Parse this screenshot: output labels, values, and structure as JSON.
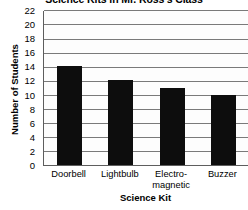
{
  "chart_data": {
    "type": "bar",
    "title": "Science Kits in Mr. Ross's Class",
    "xlabel": "Science Kit",
    "ylabel": "Number of Students",
    "categories": [
      "Doorbell",
      "Lightbulb",
      "Electro-magnetic",
      "Buzzer"
    ],
    "category_lines": [
      [
        "Doorbell"
      ],
      [
        "Lightbulb"
      ],
      [
        "Electro-",
        "magnetic"
      ],
      [
        "Buzzer"
      ]
    ],
    "values": [
      14,
      12,
      11,
      10
    ],
    "ylim": [
      0,
      22
    ],
    "ytick_step": 2,
    "ytick_labels": [
      "22",
      "20",
      "18",
      "16",
      "14",
      "12",
      "10",
      "8",
      "6",
      "4",
      "2",
      "0"
    ],
    "ytick_values": [
      22,
      20,
      18,
      16,
      14,
      12,
      10,
      8,
      6,
      4,
      2,
      0
    ],
    "grid": "horizontal",
    "legend": "none",
    "bar_color": "#0d0d0d",
    "gridline_color": "#7a7a7a",
    "axis_color": "#5d5d5d",
    "background_color": "#ffffff"
  }
}
